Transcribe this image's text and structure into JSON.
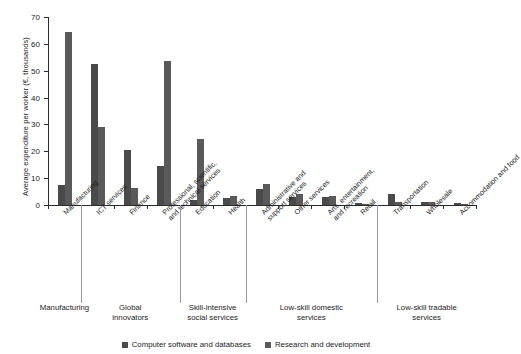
{
  "chart_data": {
    "type": "bar",
    "title": "",
    "xlabel": "",
    "ylabel": "Average expenditure per worker (€, thousands)",
    "ylim": [
      0,
      70
    ],
    "yticks": [
      0,
      10,
      20,
      30,
      40,
      50,
      60,
      70
    ],
    "grid": false,
    "legend_position": "bottom",
    "categories": [
      "Manufacturing",
      "ICT services",
      "Finance",
      "Professional, scientific, and technical services",
      "Education",
      "Health",
      "Administrative and support services",
      "Other services",
      "Arts, entertainment, and recreation",
      "Retail",
      "Transportation",
      "Wholesale",
      "Accommodation and food"
    ],
    "series": [
      {
        "name": "Computer software and databases",
        "color": "#4a4a4a",
        "values": [
          7.5,
          52.5,
          20.5,
          14.5,
          2.0,
          2.5,
          6.0,
          3.0,
          3.0,
          0.6,
          4.0,
          1.0,
          0.6
        ]
      },
      {
        "name": "Research and development",
        "color": "#5a5a5a",
        "values": [
          64.5,
          29.0,
          6.5,
          53.5,
          24.5,
          3.5,
          8.0,
          4.0,
          3.5,
          0.5,
          1.0,
          1.0,
          0.4
        ]
      }
    ],
    "group_captions": [
      "Manufacturing",
      "Global innovators",
      "Skill-intensive social services",
      "Low-skill domestic services",
      "Low-skill tradable services"
    ],
    "group_spans": [
      {
        "label": "Manufacturing",
        "from": 0,
        "to": 0
      },
      {
        "label": "Global innovators",
        "from": 1,
        "to": 3
      },
      {
        "label": "Skill-intensive social services",
        "from": 4,
        "to": 5
      },
      {
        "label": "Low-skill domestic services",
        "from": 6,
        "to": 9
      },
      {
        "label": "Low-skill tradable services",
        "from": 10,
        "to": 12
      }
    ]
  },
  "legend": {
    "items": [
      {
        "label": "Computer software and databases",
        "color": "#4a4a4a"
      },
      {
        "label": "Research and development",
        "color": "#5a5a5a"
      }
    ]
  },
  "category_label_lines": [
    [
      "Manufacturing"
    ],
    [
      "ICT services"
    ],
    [
      "Finance"
    ],
    [
      "Professional, scientific,",
      "and technical services"
    ],
    [
      "Education"
    ],
    [
      "Health"
    ],
    [
      "Administrative and",
      "support services"
    ],
    [
      "Other services"
    ],
    [
      "Arts, entertainment,",
      "and recreation"
    ],
    [
      "Retail"
    ],
    [
      "Transportation"
    ],
    [
      "Wholesale"
    ],
    [
      "Accommodation and food"
    ]
  ],
  "group_caption_lines": [
    [
      "Manufacturing"
    ],
    [
      "Global",
      "innovators"
    ],
    [
      "Skill-intensive",
      "social services"
    ],
    [
      "Low-skill domestic",
      "services"
    ],
    [
      "Low-skill tradable",
      "services"
    ]
  ]
}
